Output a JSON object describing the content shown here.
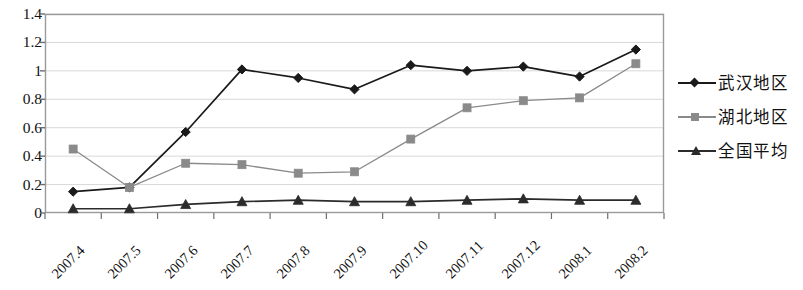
{
  "chart_data": {
    "type": "line",
    "title": "",
    "subtitle": "",
    "xlabel": "",
    "ylabel": "",
    "categories": [
      "2007.4",
      "2007.5",
      "2007.6",
      "2007.7",
      "2007.8",
      "2007.9",
      "2007.10",
      "2007.11",
      "2007.12",
      "2008.1",
      "2008.2"
    ],
    "series": [
      {
        "name": "武汉地区",
        "marker": "diamond",
        "color": "#1a1a1a",
        "values": [
          0.15,
          0.18,
          0.57,
          1.01,
          0.95,
          0.87,
          1.04,
          1.0,
          1.03,
          0.96,
          1.15
        ]
      },
      {
        "name": "湖北地区",
        "marker": "square",
        "color": "#8a8a8a",
        "values": [
          0.45,
          0.18,
          0.35,
          0.34,
          0.28,
          0.29,
          0.52,
          0.74,
          0.79,
          0.81,
          1.05
        ]
      },
      {
        "name": "全国平均",
        "marker": "triangle",
        "color": "#2b2b2b",
        "values": [
          0.03,
          0.03,
          0.06,
          0.08,
          0.09,
          0.08,
          0.08,
          0.09,
          0.1,
          0.09,
          0.09
        ]
      }
    ],
    "yticks": [
      "0",
      "0.2",
      "0.4",
      "0.6",
      "0.8",
      "1",
      "1.2",
      "1.4"
    ],
    "ytick_values": [
      0,
      0.2,
      0.4,
      0.6,
      0.8,
      1.0,
      1.2,
      1.4
    ],
    "ylim": [
      0,
      1.4
    ],
    "grid": true,
    "grid_axis": "y",
    "legend_position": "right",
    "plot_bg": "#ffffff",
    "border_color": "#9a9a9a",
    "grid_color": "#d8d8d8"
  },
  "legend": {
    "items": [
      {
        "label": "武汉地区",
        "marker": "diamond",
        "color": "#1a1a1a"
      },
      {
        "label": "湖北地区",
        "marker": "square",
        "color": "#8a8a8a"
      },
      {
        "label": "全国平均",
        "marker": "triangle",
        "color": "#2b2b2b"
      }
    ]
  }
}
